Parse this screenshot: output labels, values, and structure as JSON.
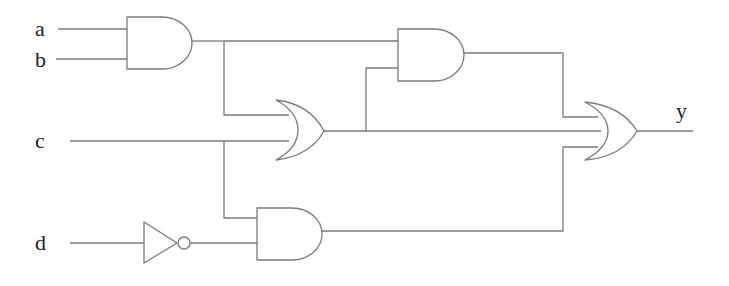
{
  "diagram": {
    "type": "logic-circuit",
    "colors": {
      "wire": "#7a7a7a",
      "text": "#222222",
      "background": "#ffffff"
    },
    "inputs": [
      {
        "name": "a",
        "label": "a"
      },
      {
        "name": "b",
        "label": "b"
      },
      {
        "name": "c",
        "label": "c"
      },
      {
        "name": "d",
        "label": "d"
      }
    ],
    "outputs": [
      {
        "name": "y",
        "label": "y"
      }
    ],
    "gates": [
      {
        "id": "and1",
        "type": "AND",
        "inputs": [
          "a",
          "b"
        ]
      },
      {
        "id": "or1",
        "type": "OR",
        "inputs": [
          "and1",
          "c"
        ]
      },
      {
        "id": "and2",
        "type": "AND",
        "inputs": [
          "and1",
          "or1"
        ]
      },
      {
        "id": "not1",
        "type": "NOT",
        "inputs": [
          "d"
        ]
      },
      {
        "id": "and3",
        "type": "AND",
        "inputs": [
          "c",
          "not1"
        ]
      },
      {
        "id": "or2",
        "type": "OR",
        "inputs": [
          "and2",
          "or1",
          "and3"
        ]
      }
    ],
    "expression": "y = (ab)(ab + c) + (ab + c) + c·d'"
  }
}
